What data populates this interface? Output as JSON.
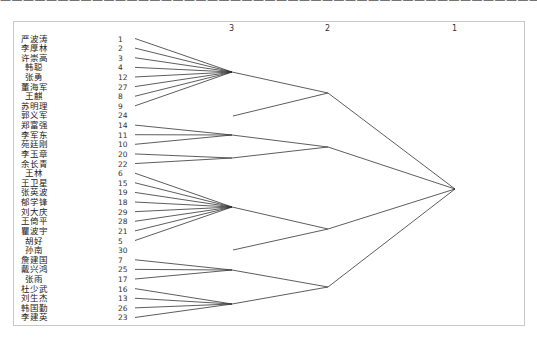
{
  "top_text": "————————————————————————————————————————————————",
  "chart_data": {
    "type": "dendrogram",
    "title": "",
    "levels": [
      {
        "label": "3",
        "x": 232
      },
      {
        "label": "2",
        "x": 328
      },
      {
        "label": "1",
        "x": 455
      }
    ],
    "leaves": [
      {
        "name": "严波涛",
        "id": "1"
      },
      {
        "name": "李厚林",
        "id": "2"
      },
      {
        "name": "许崇高",
        "id": "3"
      },
      {
        "name": "韩聪",
        "id": "4"
      },
      {
        "name": "张勇",
        "id": "12"
      },
      {
        "name": "董海军",
        "id": "27"
      },
      {
        "name": "王麒",
        "id": "8"
      },
      {
        "name": "苏明理",
        "id": "9"
      },
      {
        "name": "郭义军",
        "id": "24"
      },
      {
        "name": "郑富强",
        "id": "14"
      },
      {
        "name": "李军东",
        "id": "11"
      },
      {
        "name": "苑廷刚",
        "id": "10"
      },
      {
        "name": "李玉章",
        "id": "20"
      },
      {
        "name": "余长青",
        "id": "22"
      },
      {
        "name": "王林",
        "id": "6"
      },
      {
        "name": "王卫星",
        "id": "15"
      },
      {
        "name": "张英波",
        "id": "19"
      },
      {
        "name": "郁学锋",
        "id": "18"
      },
      {
        "name": "刘大庆",
        "id": "29"
      },
      {
        "name": "王倚平",
        "id": "28"
      },
      {
        "name": "瞿波宇",
        "id": "21"
      },
      {
        "name": "胡好",
        "id": "5"
      },
      {
        "name": "孙南",
        "id": "30"
      },
      {
        "name": "詹建国",
        "id": "7"
      },
      {
        "name": "戴兴鸿",
        "id": "25"
      },
      {
        "name": "张雨",
        "id": "17"
      },
      {
        "name": "杜少武",
        "id": "16"
      },
      {
        "name": "刘生杰",
        "id": "13"
      },
      {
        "name": "韩国勤",
        "id": "26"
      },
      {
        "name": "李建英",
        "id": "23"
      }
    ],
    "clusters_level3": [
      {
        "members": [
          "1",
          "2",
          "3",
          "4",
          "12",
          "27",
          "8",
          "9"
        ],
        "node": [
          232,
          72
        ]
      },
      {
        "members": [
          "24"
        ],
        "node": [
          233,
          116
        ]
      },
      {
        "members": [
          "14",
          "11",
          "10"
        ],
        "node": [
          232,
          135
        ]
      },
      {
        "members": [
          "20",
          "22"
        ],
        "node": [
          232,
          158
        ]
      },
      {
        "members": [
          "6",
          "15",
          "19",
          "18",
          "29",
          "28",
          "21",
          "5"
        ],
        "node": [
          232,
          207
        ]
      },
      {
        "members": [
          "30"
        ],
        "node": [
          233,
          250
        ]
      },
      {
        "members": [
          "7",
          "25",
          "17"
        ],
        "node": [
          232,
          270
        ]
      },
      {
        "members": [
          "16",
          "13",
          "26",
          "23"
        ],
        "node": [
          232,
          304
        ]
      }
    ],
    "clusters_level2": [
      {
        "members_nodes": [
          0,
          1
        ],
        "node": [
          328,
          93
        ]
      },
      {
        "members_nodes": [
          2,
          3
        ],
        "node": [
          328,
          147
        ]
      },
      {
        "members_nodes": [
          4,
          5
        ],
        "node": [
          328,
          229
        ]
      },
      {
        "members_nodes": [
          6,
          7
        ],
        "node": [
          328,
          287
        ]
      }
    ],
    "root": [
      455,
      189
    ]
  }
}
